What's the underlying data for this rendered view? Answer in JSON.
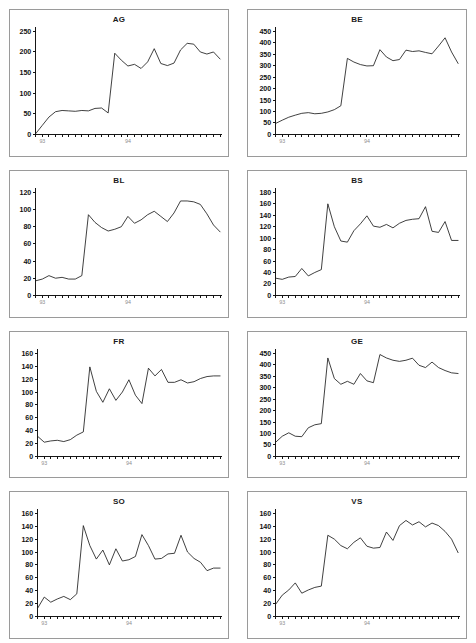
{
  "figure": {
    "type": "multi-panel-line-chart",
    "panel_count": 8,
    "columns": 2,
    "rows": 4,
    "line_color": "#1a1a1a",
    "border_color": "#9a9a9a",
    "background": "#ffffff",
    "x_tick_labels": [
      "93",
      "94"
    ]
  },
  "chart_data": [
    {
      "type": "line",
      "title": "AG",
      "xlabel": "",
      "ylabel": "",
      "xlim": [
        0,
        28
      ],
      "ylim": [
        0,
        250
      ],
      "yticks": [
        0,
        50,
        100,
        150,
        200,
        250
      ],
      "xtick_labels": [
        "93",
        "94"
      ],
      "xtick_label_positions": [
        1,
        14
      ],
      "grid": false,
      "legend": "none",
      "x": [
        0,
        1,
        2,
        3,
        4,
        5,
        6,
        7,
        8,
        9,
        10,
        11,
        12,
        13,
        14,
        15,
        16,
        17,
        18,
        19,
        20,
        21,
        22,
        23,
        24,
        25,
        26,
        27,
        28
      ],
      "values": [
        2,
        22,
        42,
        55,
        58,
        57,
        56,
        58,
        57,
        63,
        64,
        52,
        197,
        180,
        166,
        170,
        160,
        176,
        208,
        172,
        167,
        173,
        205,
        221,
        219,
        200,
        195,
        200,
        183
      ]
    },
    {
      "type": "line",
      "title": "BE",
      "xlabel": "",
      "ylabel": "",
      "xlim": [
        0,
        28
      ],
      "ylim": [
        0,
        450
      ],
      "yticks": [
        0,
        50,
        100,
        150,
        200,
        250,
        300,
        350,
        400,
        450
      ],
      "xtick_labels": [
        "93",
        "94"
      ],
      "xtick_label_positions": [
        1,
        14
      ],
      "grid": false,
      "legend": "none",
      "x": [
        0,
        1,
        2,
        3,
        4,
        5,
        6,
        7,
        8,
        9,
        10,
        11,
        12,
        13,
        14,
        15,
        16,
        17,
        18,
        19,
        20,
        21,
        22,
        23,
        24,
        25,
        26,
        27,
        28
      ],
      "values": [
        48,
        62,
        75,
        84,
        92,
        95,
        90,
        92,
        98,
        108,
        125,
        332,
        316,
        305,
        299,
        300,
        370,
        338,
        322,
        327,
        368,
        362,
        365,
        358,
        352,
        386,
        422,
        360,
        310
      ]
    },
    {
      "type": "line",
      "title": "BL",
      "xlabel": "",
      "ylabel": "",
      "xlim": [
        0,
        28
      ],
      "ylim": [
        0,
        120
      ],
      "yticks": [
        0,
        20,
        40,
        60,
        80,
        100,
        120
      ],
      "xtick_labels": [
        "93",
        "94"
      ],
      "xtick_label_positions": [
        1,
        14
      ],
      "grid": false,
      "legend": "none",
      "x": [
        0,
        1,
        2,
        3,
        4,
        5,
        6,
        7,
        8,
        9,
        10,
        11,
        12,
        13,
        14,
        15,
        16,
        17,
        18,
        19,
        20,
        21,
        22,
        23,
        24,
        25,
        26,
        27,
        28
      ],
      "values": [
        17,
        19,
        23,
        20,
        21,
        19,
        19,
        23,
        94,
        85,
        79,
        75,
        77,
        80,
        92,
        84,
        88,
        94,
        98,
        92,
        86,
        96,
        110,
        110,
        109,
        106,
        95,
        82,
        74
      ]
    },
    {
      "type": "line",
      "title": "BS",
      "xlabel": "",
      "ylabel": "",
      "xlim": [
        0,
        28
      ],
      "ylim": [
        0,
        180
      ],
      "yticks": [
        0,
        20,
        40,
        60,
        80,
        100,
        120,
        140,
        160,
        180
      ],
      "xtick_labels": [
        "93",
        "94"
      ],
      "xtick_label_positions": [
        1,
        14
      ],
      "grid": false,
      "legend": "none",
      "x": [
        0,
        1,
        2,
        3,
        4,
        5,
        6,
        7,
        8,
        9,
        10,
        11,
        12,
        13,
        14,
        15,
        16,
        17,
        18,
        19,
        20,
        21,
        22,
        23,
        24,
        25,
        26,
        27,
        28
      ],
      "values": [
        30,
        28,
        32,
        33,
        47,
        34,
        40,
        45,
        160,
        120,
        95,
        93,
        113,
        125,
        139,
        121,
        119,
        124,
        118,
        126,
        131,
        133,
        134,
        155,
        112,
        110,
        129,
        96,
        96
      ]
    },
    {
      "type": "line",
      "title": "FR",
      "xlabel": "",
      "ylabel": "",
      "xlim": [
        0,
        28
      ],
      "ylim": [
        0,
        160
      ],
      "yticks": [
        0,
        20,
        40,
        60,
        80,
        100,
        120,
        140,
        160
      ],
      "xtick_labels": [
        "93",
        "94"
      ],
      "xtick_label_positions": [
        1,
        14
      ],
      "grid": false,
      "legend": "none",
      "x": [
        0,
        1,
        2,
        3,
        4,
        5,
        6,
        7,
        8,
        9,
        10,
        11,
        12,
        13,
        14,
        15,
        16,
        17,
        18,
        19,
        20,
        21,
        22,
        23,
        24,
        25,
        26,
        27,
        28
      ],
      "values": [
        31,
        22,
        24,
        25,
        23,
        26,
        33,
        38,
        139,
        101,
        84,
        105,
        87,
        100,
        119,
        95,
        82,
        137,
        125,
        135,
        115,
        115,
        119,
        114,
        116,
        121,
        124,
        125,
        125
      ]
    },
    {
      "type": "line",
      "title": "GE",
      "xlabel": "",
      "ylabel": "",
      "xlim": [
        0,
        28
      ],
      "ylim": [
        0,
        450
      ],
      "yticks": [
        0,
        50,
        100,
        150,
        200,
        250,
        300,
        350,
        400,
        450
      ],
      "xtick_labels": [
        "93",
        "94"
      ],
      "xtick_label_positions": [
        1,
        14
      ],
      "grid": false,
      "legend": "none",
      "x": [
        0,
        1,
        2,
        3,
        4,
        5,
        6,
        7,
        8,
        9,
        10,
        11,
        12,
        13,
        14,
        15,
        16,
        17,
        18,
        19,
        20,
        21,
        22,
        23,
        24,
        25,
        26,
        27,
        28
      ],
      "values": [
        62,
        88,
        103,
        88,
        86,
        125,
        138,
        143,
        430,
        340,
        315,
        328,
        315,
        362,
        330,
        322,
        445,
        430,
        420,
        415,
        420,
        429,
        398,
        388,
        412,
        388,
        375,
        365,
        362
      ]
    },
    {
      "type": "line",
      "title": "SO",
      "xlabel": "",
      "ylabel": "",
      "xlim": [
        0,
        28
      ],
      "ylim": [
        0,
        160
      ],
      "yticks": [
        0,
        20,
        40,
        60,
        80,
        100,
        120,
        140,
        160
      ],
      "xtick_labels": [
        "93",
        "94"
      ],
      "xtick_label_positions": [
        1,
        14
      ],
      "grid": false,
      "legend": "none",
      "x": [
        0,
        1,
        2,
        3,
        4,
        5,
        6,
        7,
        8,
        9,
        10,
        11,
        12,
        13,
        14,
        15,
        16,
        17,
        18,
        19,
        20,
        21,
        22,
        23,
        24,
        25,
        26,
        27,
        28
      ],
      "values": [
        13,
        30,
        22,
        27,
        31,
        26,
        35,
        141,
        110,
        89,
        103,
        80,
        105,
        86,
        88,
        93,
        127,
        110,
        89,
        90,
        97,
        98,
        126,
        100,
        90,
        84,
        71,
        75,
        75
      ]
    },
    {
      "type": "line",
      "title": "VS",
      "xlabel": "",
      "ylabel": "",
      "xlim": [
        0,
        28
      ],
      "ylim": [
        0,
        160
      ],
      "yticks": [
        0,
        20,
        40,
        60,
        80,
        100,
        120,
        140,
        160
      ],
      "xtick_labels": [
        "93",
        "94"
      ],
      "xtick_label_positions": [
        1,
        14
      ],
      "grid": false,
      "legend": "none",
      "x": [
        0,
        1,
        2,
        3,
        4,
        5,
        6,
        7,
        8,
        9,
        10,
        11,
        12,
        13,
        14,
        15,
        16,
        17,
        18,
        19,
        20,
        21,
        22,
        23,
        24,
        25,
        26,
        27,
        28
      ],
      "values": [
        19,
        33,
        41,
        52,
        36,
        41,
        45,
        47,
        126,
        120,
        110,
        105,
        115,
        122,
        109,
        106,
        107,
        131,
        118,
        141,
        149,
        142,
        147,
        139,
        145,
        141,
        132,
        120,
        99
      ]
    }
  ]
}
